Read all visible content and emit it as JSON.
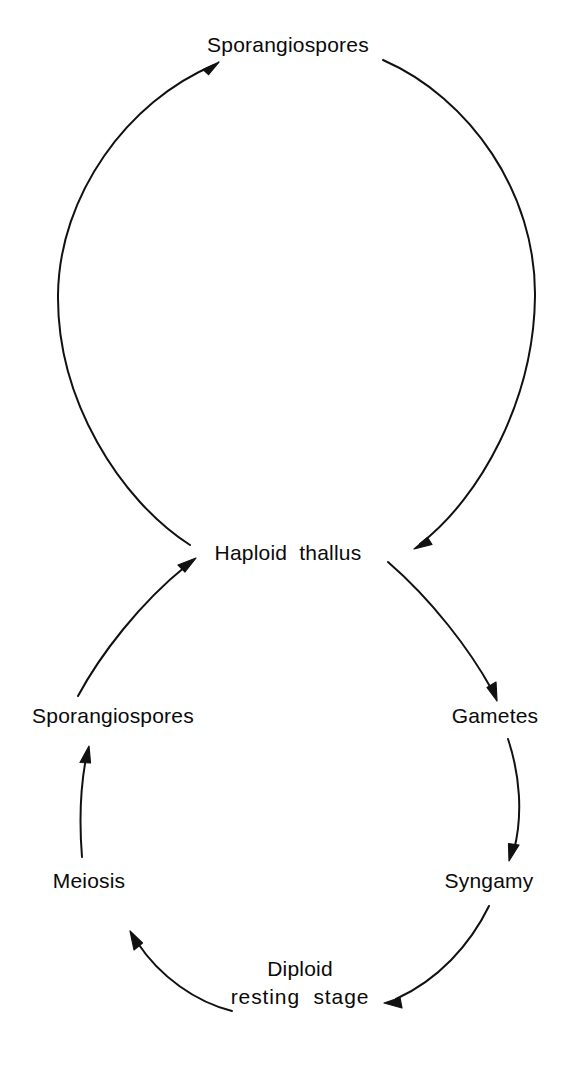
{
  "diagram": {
    "type": "cycle-diagram",
    "background_color": "#ffffff",
    "stroke_color": "#111111",
    "text_color": "#0a0a0a",
    "nodes": [
      {
        "id": "sporangiospores_top",
        "label": "Sporangiospores",
        "x": 288,
        "y": 45
      },
      {
        "id": "haploid_thallus",
        "label": "Haploid  thallus",
        "x": 288,
        "y": 553
      },
      {
        "id": "sporangiospores_lower",
        "label": "Sporangiospores",
        "x": 113,
        "y": 716
      },
      {
        "id": "gametes",
        "label": "Gametes",
        "x": 495,
        "y": 716
      },
      {
        "id": "meiosis",
        "label": "Meiosis",
        "x": 89,
        "y": 881
      },
      {
        "id": "syngamy",
        "label": "Syngamy",
        "x": 489,
        "y": 881
      },
      {
        "id": "diploid_resting_stage_line1",
        "label": "Diploid",
        "x": 300,
        "y": 969
      },
      {
        "id": "diploid_resting_stage_line2",
        "label": "resting  stage",
        "x": 300,
        "y": 997
      }
    ],
    "edges": [
      {
        "id": "haploid-to-sporangiospores-top",
        "from": "Haploid thallus",
        "to": "Sporangiospores",
        "arrowhead": "at-target"
      },
      {
        "id": "sporangiospores-top-to-haploid",
        "from": "Sporangiospores",
        "to": "Haploid thallus",
        "arrowhead": "at-target"
      },
      {
        "id": "haploid-to-gametes",
        "from": "Haploid thallus",
        "to": "Gametes",
        "arrowhead": "at-target"
      },
      {
        "id": "gametes-to-syngamy",
        "from": "Gametes",
        "to": "Syngamy",
        "arrowhead": "at-target"
      },
      {
        "id": "syngamy-to-diploid",
        "from": "Syngamy",
        "to": "Diploid resting stage",
        "arrowhead": "at-target"
      },
      {
        "id": "diploid-to-meiosis",
        "from": "Diploid resting stage",
        "to": "Meiosis",
        "arrowhead": "at-target"
      },
      {
        "id": "meiosis-to-sporangiospores-lower",
        "from": "Meiosis",
        "to": "Sporangiospores",
        "arrowhead": "at-target"
      },
      {
        "id": "sporangiospores-lower-to-haploid",
        "from": "Sporangiospores",
        "to": "Haploid thallus",
        "arrowhead": "at-target"
      }
    ]
  }
}
